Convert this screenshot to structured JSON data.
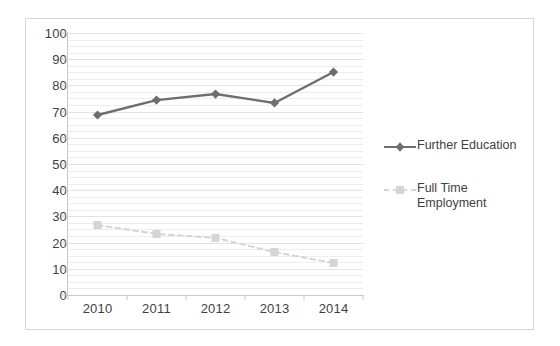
{
  "chart_data": {
    "type": "line",
    "title": "",
    "subtitle": "",
    "xlabel": "",
    "ylabel": "",
    "categories": [
      "2010",
      "2011",
      "2012",
      "2013",
      "2014"
    ],
    "ylim": [
      0,
      100
    ],
    "ytick_step": 10,
    "yticks": [
      100,
      90,
      80,
      70,
      60,
      50,
      40,
      30,
      20,
      10,
      0
    ],
    "grid": true,
    "grid_orientation": "horizontal",
    "legend_position": "right",
    "series": [
      {
        "name": "Further Education",
        "values": [
          68.7,
          74.4,
          76.7,
          73.3,
          85.1
        ],
        "color": "#6e6e6e",
        "marker": "diamond",
        "line_style": "solid"
      },
      {
        "name": "Full Time Employment",
        "values": [
          26.7,
          23.3,
          21.8,
          16.4,
          12.2
        ],
        "color": "#d5d5d5",
        "marker": "square",
        "line_style": "dashed"
      }
    ]
  },
  "legend": {
    "items": [
      {
        "label": "Further Education"
      },
      {
        "label": "Full Time Employment"
      }
    ]
  },
  "colors": {
    "series_1": "#6e6e6e",
    "series_2": "#d5d5d5",
    "axis": "#c9c9c9",
    "grid_minor": "#eceded",
    "grid_major": "#e2e3e3",
    "frame": "#d6d6d6",
    "text": "#3f3f3f",
    "background": "#ffffff"
  }
}
